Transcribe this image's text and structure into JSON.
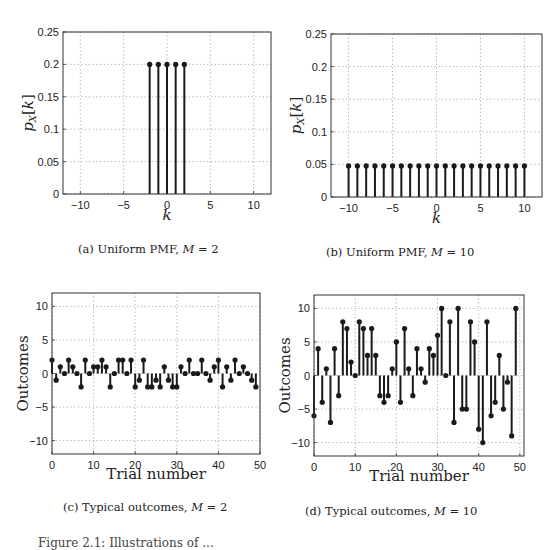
{
  "figure": {
    "captions": {
      "a": {
        "prefix": "(a) Uniform PMF, ",
        "var": "M",
        "eq": " = 2"
      },
      "b": {
        "prefix": "(b) Uniform PMF, ",
        "var": "M",
        "eq": " = 10"
      },
      "c": {
        "prefix": "(c) Typical outcomes, ",
        "var": "M",
        "eq": " = 2"
      },
      "d": {
        "prefix": "(d) Typical outcomes, ",
        "var": "M",
        "eq": " = 10"
      }
    },
    "bottom_caption_fragment": "Figure 2.1: Illustrations of ..."
  },
  "chart_data": [
    {
      "id": "a",
      "type": "stem",
      "title": "(a) Uniform PMF, M = 2",
      "xlabel": "k",
      "ylabel": "p_X[k]",
      "xlim": [
        -12,
        12
      ],
      "ylim": [
        0,
        0.25
      ],
      "xticks": [
        -10,
        -5,
        0,
        5,
        10
      ],
      "yticks": [
        0,
        0.05,
        0.1,
        0.15,
        0.2,
        0.25
      ],
      "ytick_labels": [
        "0",
        "0.05",
        "0.1",
        "0.15",
        "0.2",
        "0.25"
      ],
      "grid": true,
      "x": [
        -2,
        -1,
        0,
        1,
        2
      ],
      "values": [
        0.2,
        0.2,
        0.2,
        0.2,
        0.2
      ]
    },
    {
      "id": "b",
      "type": "stem",
      "title": "(b) Uniform PMF, M = 10",
      "xlabel": "k",
      "ylabel": "p_X[k]",
      "xlim": [
        -12,
        12
      ],
      "ylim": [
        0,
        0.25
      ],
      "xticks": [
        -10,
        -5,
        0,
        5,
        10
      ],
      "yticks": [
        0,
        0.05,
        0.1,
        0.15,
        0.2,
        0.25
      ],
      "ytick_labels": [
        "0",
        "0.05",
        "0.1",
        "0.15",
        "0.2",
        "0.25"
      ],
      "grid": true,
      "x": [
        -10,
        -9,
        -8,
        -7,
        -6,
        -5,
        -4,
        -3,
        -2,
        -1,
        0,
        1,
        2,
        3,
        4,
        5,
        6,
        7,
        8,
        9,
        10
      ],
      "values": [
        0.0476,
        0.0476,
        0.0476,
        0.0476,
        0.0476,
        0.0476,
        0.0476,
        0.0476,
        0.0476,
        0.0476,
        0.0476,
        0.0476,
        0.0476,
        0.0476,
        0.0476,
        0.0476,
        0.0476,
        0.0476,
        0.0476,
        0.0476,
        0.0476
      ]
    },
    {
      "id": "c",
      "type": "stem",
      "title": "(c) Typical outcomes, M = 2",
      "xlabel": "Trial number",
      "ylabel": "Outcomes",
      "xlim": [
        0,
        50
      ],
      "ylim": [
        -12,
        12
      ],
      "xticks": [
        0,
        10,
        20,
        30,
        40,
        50
      ],
      "yticks": [
        -10,
        -5,
        0,
        5,
        10
      ],
      "ytick_labels": [
        "−10",
        "−5",
        "0",
        "5",
        "10"
      ],
      "grid": true,
      "x": [
        0,
        1,
        2,
        3,
        4,
        5,
        6,
        7,
        8,
        9,
        10,
        11,
        12,
        13,
        14,
        15,
        16,
        17,
        18,
        19,
        20,
        21,
        22,
        23,
        24,
        25,
        26,
        27,
        28,
        29,
        30,
        31,
        32,
        33,
        34,
        35,
        36,
        37,
        38,
        39,
        40,
        41,
        42,
        43,
        44,
        45,
        46,
        47,
        48,
        49
      ],
      "values": [
        2,
        -1,
        1,
        0,
        2,
        1,
        0,
        -2,
        2,
        0,
        1,
        1,
        2,
        1,
        -2,
        0,
        2,
        2,
        0,
        2,
        -2,
        -1,
        2,
        -2,
        -2,
        -1,
        -2,
        1,
        -1,
        -2,
        -2,
        1,
        0,
        2,
        0,
        0,
        2,
        0,
        -1,
        1,
        2,
        -2,
        1,
        -1,
        2,
        0,
        1,
        0,
        -1,
        -2
      ]
    },
    {
      "id": "d",
      "type": "stem",
      "title": "(d) Typical outcomes, M = 10",
      "xlabel": "Trial number",
      "ylabel": "Outcomes",
      "xlim": [
        0,
        51
      ],
      "ylim": [
        -12,
        12
      ],
      "xticks": [
        0,
        10,
        20,
        30,
        40,
        50
      ],
      "yticks": [
        -10,
        -5,
        0,
        5,
        10
      ],
      "ytick_labels": [
        "−10",
        "−5",
        "0",
        "5",
        "10"
      ],
      "grid": true,
      "x": [
        0,
        1,
        2,
        3,
        4,
        5,
        6,
        7,
        8,
        9,
        10,
        11,
        12,
        13,
        14,
        15,
        16,
        17,
        18,
        19,
        20,
        21,
        22,
        23,
        24,
        25,
        26,
        27,
        28,
        29,
        30,
        31,
        32,
        33,
        34,
        35,
        36,
        37,
        38,
        39,
        40,
        41,
        42,
        43,
        44,
        45,
        46,
        47,
        48,
        49
      ],
      "values": [
        -6,
        4,
        -4,
        1,
        -7,
        4,
        -3,
        8,
        7,
        2,
        0,
        8,
        7,
        3,
        7,
        3,
        -3,
        -4,
        -3,
        1,
        5,
        -4,
        7,
        1,
        -3,
        4,
        1,
        -1,
        4,
        3,
        6,
        10,
        0,
        8,
        -7,
        10,
        -5,
        -5,
        8,
        5,
        -8,
        -10,
        8,
        -6,
        -4,
        3,
        -5,
        -1,
        -9,
        10
      ]
    }
  ]
}
